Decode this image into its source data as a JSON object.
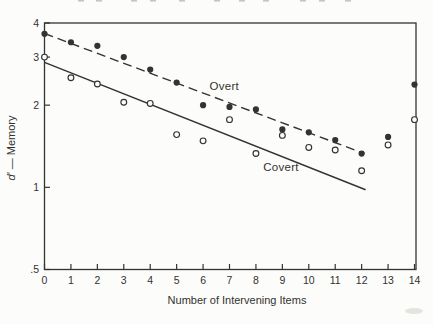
{
  "figure": {
    "bg_color": "#fcfcfa",
    "ink_color": "#333330",
    "faint_color": "#c9c5bd",
    "top_fragment_xs": [
      78,
      96,
      131,
      150,
      179,
      214,
      239,
      263,
      300,
      319,
      345
    ],
    "smudge": {
      "x": 414,
      "y": 311
    }
  },
  "chart_data": {
    "type": "scatter",
    "title": "",
    "xlabel": "Number of Intervening Items",
    "ylabel": "d′ — Memory",
    "ylabel_parts": {
      "italic": "d′",
      "rest": " — Memory"
    },
    "y_scale": "log",
    "xlim": [
      0,
      14
    ],
    "ylim": [
      0.5,
      4
    ],
    "x": [
      0,
      1,
      2,
      3,
      4,
      5,
      6,
      7,
      8,
      9,
      10,
      11,
      12,
      13,
      14
    ],
    "y_ticks": [
      {
        "v": 4,
        "label": "4"
      },
      {
        "v": 3,
        "label": "3"
      },
      {
        "v": 2,
        "label": "2"
      },
      {
        "v": 1,
        "label": "1"
      },
      {
        "v": 0.5,
        "label": ".5"
      }
    ],
    "grid": false,
    "legend": "inline-labels",
    "series": [
      {
        "name": "Overt",
        "marker": "filled-circle",
        "line": "dashed",
        "values": [
          3.65,
          3.4,
          3.3,
          3.0,
          2.7,
          2.42,
          2.0,
          1.97,
          1.93,
          1.63,
          1.59,
          1.49,
          1.33,
          1.53,
          2.38
        ],
        "label_pos": {
          "x": 6.8,
          "y": 2.36
        }
      },
      {
        "name": "Covert",
        "marker": "open-circle",
        "line": "solid",
        "values": [
          3.0,
          2.52,
          2.39,
          2.05,
          2.03,
          1.56,
          1.48,
          1.77,
          1.33,
          1.55,
          1.4,
          1.37,
          1.15,
          1.43,
          1.77
        ],
        "label_pos": {
          "x": 8.95,
          "y": 1.19
        }
      }
    ],
    "trend_lines": [
      {
        "series": "Overt",
        "style": "dashed",
        "x_start": 0,
        "y_start": 3.66,
        "x_end": 12.1,
        "y_end": 1.33
      },
      {
        "series": "Covert",
        "style": "solid",
        "x_start": 0,
        "y_start": 2.87,
        "x_end": 12.15,
        "y_end": 0.98
      }
    ]
  }
}
